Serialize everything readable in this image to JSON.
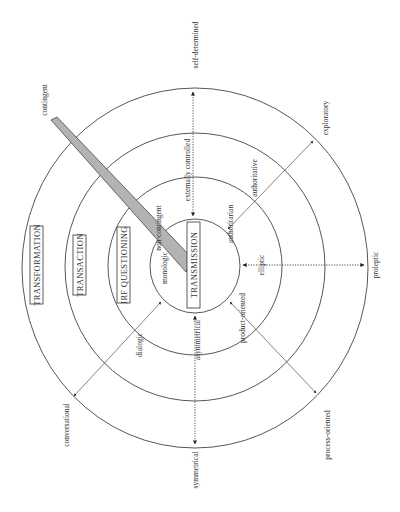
{
  "diagram": {
    "center": {
      "x": 195,
      "y": 266
    },
    "rings": [
      {
        "name": "transmission",
        "rx": 45,
        "ry": 47
      },
      {
        "name": "irf-questioning",
        "rx": 87,
        "ry": 89
      },
      {
        "name": "transaction",
        "rx": 130,
        "ry": 134
      },
      {
        "name": "transformation",
        "rx": 173,
        "ry": 180
      }
    ],
    "ring_labels": {
      "transmission": "TRANSMISSION",
      "irf_questioning": "IRF QUESTIONING",
      "transaction": "TRANSACTION",
      "transformation": "TRANSFORMATION"
    },
    "band": {
      "outer_label": "contingent",
      "inner_label": "non-contingent",
      "color": "#b3b3b3"
    },
    "axes": {
      "top": {
        "inner": "externally controlled",
        "outer": "self-determined"
      },
      "bottom": {
        "inner": "asymmetrical",
        "outer": "symmetrical"
      },
      "right": {
        "inner": "elliptic",
        "outer": "proleptic"
      },
      "upper_right": {
        "inner": "authoritarian",
        "middle": "authoritative",
        "outer": "exploratory"
      },
      "lower_right": {
        "inner": "product-oriented",
        "outer": "process-oriented"
      },
      "lower_left": {
        "inner": "dialogic",
        "outer": "conversational"
      },
      "inner_left": "monologic"
    },
    "colors": {
      "line": "#444444",
      "band_fill": "#b3b3b3",
      "text": "#333333"
    }
  }
}
